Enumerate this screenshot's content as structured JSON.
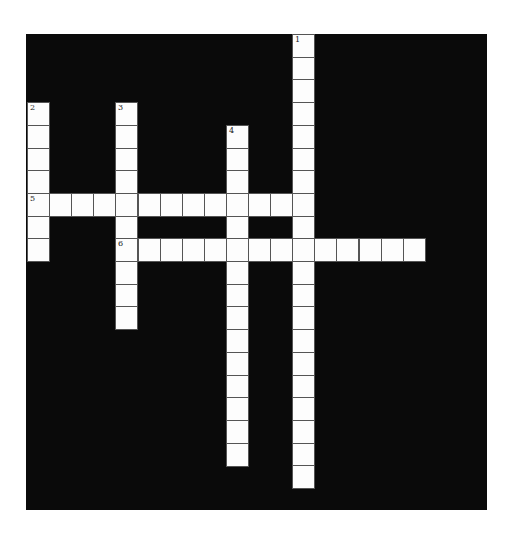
{
  "puzzle": {
    "type": "crossword",
    "grid": {
      "origin_x": 27,
      "origin_y": 34,
      "cell_w": 22.1,
      "cell_h": 22.7
    },
    "colors": {
      "background": "#0a0a0a",
      "cell": "#fdfdfd",
      "cell_border": "#555555"
    },
    "words": [
      {
        "number": "1",
        "direction": "down",
        "row": 0,
        "col": 12,
        "length": 20
      },
      {
        "number": "2",
        "direction": "down",
        "row": 3,
        "col": 0,
        "length": 7
      },
      {
        "number": "3",
        "direction": "down",
        "row": 3,
        "col": 4,
        "length": 10
      },
      {
        "number": "4",
        "direction": "down",
        "row": 4,
        "col": 9,
        "length": 15
      },
      {
        "number": "5",
        "direction": "across",
        "row": 7,
        "col": 0,
        "length": 13
      },
      {
        "number": "6",
        "direction": "across",
        "row": 9,
        "col": 4,
        "length": 14
      }
    ]
  }
}
